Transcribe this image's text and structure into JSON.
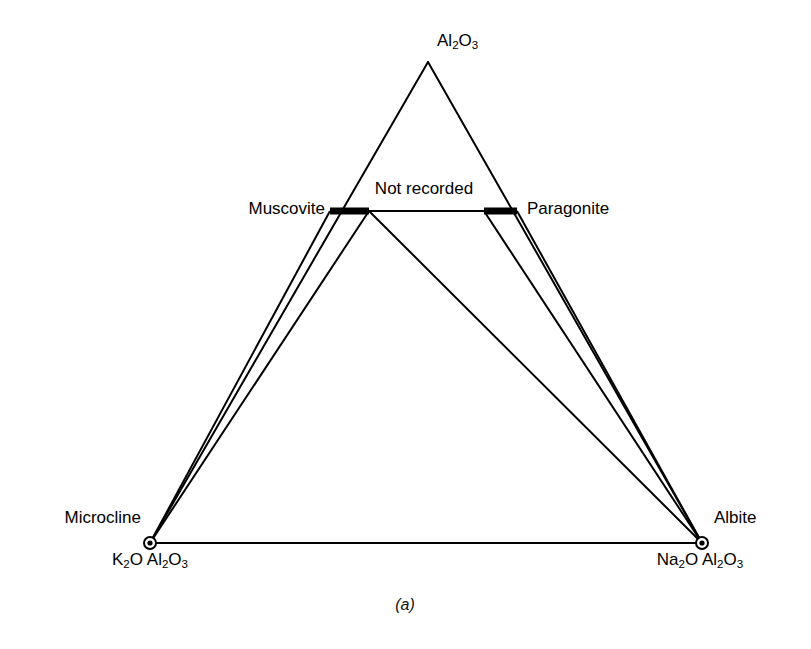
{
  "figure": {
    "caption": "(a)",
    "caption_x": 405,
    "caption_y": 596,
    "background": "#ffffff",
    "line_color": "#000000",
    "marker_fill": "#ffffff"
  },
  "geometry": {
    "apex": {
      "x": 428,
      "y": 62
    },
    "left_vertex": {
      "x": 150,
      "y": 543
    },
    "right_vertex": {
      "x": 702,
      "y": 543
    },
    "muscovite_bar": {
      "x1": 330,
      "x2": 369,
      "y": 211,
      "thickness": 7
    },
    "paragonite_bar": {
      "x1": 484,
      "x2": 517,
      "y": 211,
      "thickness": 7
    },
    "vertex_marker_radius": 6,
    "vertex_marker_inner_radius": 2.6,
    "stroke_width_outline": 2.0,
    "stroke_width_tie": 2.0
  },
  "labels": {
    "apex": {
      "text": "Al2O3",
      "html": "Al<sub>2</sub>O<sub>3</sub>",
      "x": 437,
      "y": 32,
      "anchor": "start"
    },
    "muscovite": {
      "text": "Muscovite",
      "x": 325,
      "y": 200,
      "anchor": "end"
    },
    "paragonite": {
      "text": "Paragonite",
      "x": 527,
      "y": 200,
      "anchor": "start"
    },
    "not_recorded": {
      "text": "Not recorded",
      "x": 424,
      "y": 180,
      "anchor": "mid"
    },
    "microcline": {
      "text": "Microcline",
      "x": 141,
      "y": 509,
      "anchor": "end"
    },
    "microcline_formula": {
      "text": "K2O Al2O3",
      "html": "K<sub>2</sub>O Al<sub>2</sub>O<sub>3</sub>",
      "x": 150,
      "y": 551,
      "anchor": "mid"
    },
    "albite": {
      "text": "Albite",
      "x": 714,
      "y": 509,
      "anchor": "start"
    },
    "albite_formula": {
      "text": "Na2O Al2O3",
      "html": "Na<sub>2</sub>O Al<sub>2</sub>O<sub>3</sub>",
      "x": 700,
      "y": 551,
      "anchor": "mid"
    }
  },
  "chart_data": {
    "type": "diagram",
    "subtype": "ternary-phase-diagram",
    "caption": "(a)",
    "components": [
      {
        "name": "Al2O3",
        "role": "apex",
        "position": "top"
      },
      {
        "name": "Microcline",
        "formula": "K2O Al2O3",
        "role": "vertex",
        "position": "bottom-left",
        "marker": "open-circle"
      },
      {
        "name": "Albite",
        "formula": "Na2O Al2O3",
        "role": "vertex",
        "position": "bottom-right",
        "marker": "open-circle"
      }
    ],
    "phases": [
      {
        "name": "Muscovite",
        "type": "solid-solution-bar",
        "position": "left-of-join",
        "rendered": "thick black bar"
      },
      {
        "name": "Paragonite",
        "type": "solid-solution-bar",
        "position": "right-of-join",
        "rendered": "thick black bar"
      }
    ],
    "regions": [
      {
        "label": "Not recorded",
        "description": "region between the muscovite-paragonite join and the Al2O3 apex"
      }
    ],
    "joins": [
      {
        "from": "Muscovite",
        "to": "Paragonite",
        "style": "solid",
        "note": "muscovite-paragonite solvus join"
      },
      {
        "from": "Microcline",
        "to": "Albite",
        "style": "solid",
        "note": "alkali feldspar base join"
      }
    ],
    "tie_lines": [
      {
        "from": "Microcline",
        "to": "Muscovite",
        "count": 2,
        "note": "narrow two-phase sliver converging at the muscovite bar"
      },
      {
        "from": "Muscovite",
        "to": "Albite",
        "count": 1
      },
      {
        "from": "Paragonite",
        "to": "Albite",
        "count": 2,
        "note": "narrow two-phase sliver converging at the albite vertex"
      }
    ],
    "legend_position": "none",
    "grid": false
  }
}
